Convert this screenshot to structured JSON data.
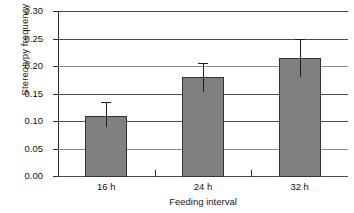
{
  "chart_data": {
    "type": "bar",
    "title": "",
    "xlabel": "Feeding interval",
    "ylabel": "Stereotypy frequency",
    "categories": [
      "16 h",
      "24 h",
      "32 h"
    ],
    "values": [
      0.11,
      0.18,
      0.215
    ],
    "errors_upper": [
      0.135,
      0.205,
      0.25
    ],
    "errors_lower": [
      0.09,
      0.152,
      0.18
    ],
    "error_bars": [
      {
        "category": "16 h",
        "value": 0.11,
        "upper": 0.135,
        "lower": 0.09
      },
      {
        "category": "24 h",
        "value": 0.18,
        "upper": 0.205,
        "lower": 0.152
      },
      {
        "category": "32 h",
        "value": 0.215,
        "upper": 0.25,
        "lower": 0.18
      }
    ],
    "ylim": [
      0.0,
      0.3
    ],
    "ytick_labels": [
      "0.30",
      "0.25",
      "0.20",
      "0.15",
      "0.10",
      "0.05",
      "0.00"
    ],
    "ytick_values": [
      0.3,
      0.25,
      0.2,
      0.15,
      0.1,
      0.05,
      0.0
    ],
    "ystep": 0.05,
    "grid": true,
    "grid_axis": "y",
    "legend": false,
    "legend_position": "none",
    "bar_color": "#808080",
    "bar_edge_color": "#333333",
    "error_bar_color": "#1f1f1f",
    "grid_color": "#4a4a4a",
    "background": "#ffffff"
  }
}
